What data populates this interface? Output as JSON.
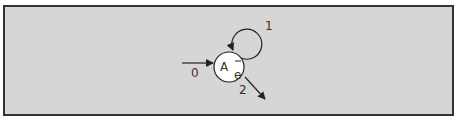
{
  "diagram": {
    "type": "state-transition",
    "colors": {
      "background": "#d6d6d6",
      "border": "#333333",
      "node_fill": "#ffffff",
      "stroke": "#222222"
    },
    "node": {
      "id": "A",
      "label_main": "A",
      "label_sub": "e",
      "overbar": "−"
    },
    "edges": [
      {
        "id": "incoming",
        "label": "0"
      },
      {
        "id": "self-loop",
        "label": "1"
      },
      {
        "id": "outgoing",
        "label": "2"
      }
    ]
  }
}
